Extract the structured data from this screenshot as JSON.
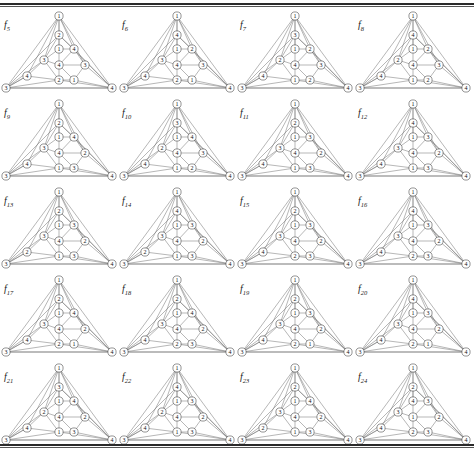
{
  "page": {
    "running_head": "",
    "figure_count": 20,
    "columns": 4,
    "rows": 5
  },
  "geometry": {
    "note": "normalised node slots shared by every graph drawing",
    "slots": {
      "apex": [
        59,
        8
      ],
      "left": [
        6,
        80
      ],
      "right": [
        112,
        80
      ],
      "upper": [
        59,
        27
      ],
      "mid_top": [
        59,
        41
      ],
      "right_top": [
        74,
        41
      ],
      "left_mid": [
        44,
        52
      ],
      "center": [
        59,
        57
      ],
      "right_mid": [
        85,
        57
      ],
      "far_left": [
        27,
        68
      ],
      "low_center": [
        59,
        72
      ],
      "low_right": [
        74,
        72
      ]
    },
    "edges": [
      [
        "apex",
        "left"
      ],
      [
        "apex",
        "right"
      ],
      [
        "left",
        "right"
      ],
      [
        "apex",
        "upper"
      ],
      [
        "apex",
        "left_mid"
      ],
      [
        "apex",
        "right_top"
      ],
      [
        "apex",
        "right_mid"
      ],
      [
        "apex",
        "far_left"
      ],
      [
        "apex",
        "mid_top"
      ],
      [
        "upper",
        "mid_top"
      ],
      [
        "upper",
        "left_mid"
      ],
      [
        "upper",
        "right_top"
      ],
      [
        "mid_top",
        "right_top"
      ],
      [
        "mid_top",
        "left_mid"
      ],
      [
        "mid_top",
        "center"
      ],
      [
        "right_top",
        "center"
      ],
      [
        "right_top",
        "right_mid"
      ],
      [
        "left_mid",
        "center"
      ],
      [
        "left_mid",
        "far_left"
      ],
      [
        "left_mid",
        "low_center"
      ],
      [
        "center",
        "right_mid"
      ],
      [
        "center",
        "low_center"
      ],
      [
        "center",
        "low_right"
      ],
      [
        "right_mid",
        "low_right"
      ],
      [
        "right_mid",
        "right"
      ],
      [
        "far_left",
        "low_center"
      ],
      [
        "far_left",
        "left"
      ],
      [
        "low_center",
        "low_right"
      ],
      [
        "low_center",
        "left"
      ],
      [
        "low_center",
        "right"
      ],
      [
        "low_right",
        "right"
      ],
      [
        "left",
        "far_left"
      ],
      [
        "left",
        "left_mid"
      ],
      [
        "right",
        "right_top"
      ],
      [
        "left",
        "upper"
      ],
      [
        "right",
        "upper"
      ]
    ]
  },
  "figures": [
    {
      "id": "f5",
      "caption": "f",
      "subscript": "5",
      "labels": {
        "apex": "1",
        "left": "3",
        "right": "4",
        "upper": "2",
        "mid_top": "1",
        "right_top": "4",
        "left_mid": "3",
        "center": "4",
        "right_mid": "3",
        "far_left": "4",
        "low_center": "2",
        "low_right": "1"
      }
    },
    {
      "id": "f6",
      "caption": "f",
      "subscript": "6",
      "labels": {
        "apex": "1",
        "left": "3",
        "right": "4",
        "upper": "4",
        "mid_top": "1",
        "right_top": "2",
        "left_mid": "3",
        "center": "4",
        "right_mid": "3",
        "far_left": "4",
        "low_center": "2",
        "low_right": "1"
      }
    },
    {
      "id": "f7",
      "caption": "f",
      "subscript": "7",
      "labels": {
        "apex": "1",
        "left": "3",
        "right": "4",
        "upper": "3",
        "mid_top": "1",
        "right_top": "2",
        "left_mid": "2",
        "center": "4",
        "right_mid": "3",
        "far_left": "4",
        "low_center": "1",
        "low_right": "2"
      }
    },
    {
      "id": "f8",
      "caption": "f",
      "subscript": "8",
      "labels": {
        "apex": "1",
        "left": "3",
        "right": "4",
        "upper": "4",
        "mid_top": "1",
        "right_top": "2",
        "left_mid": "2",
        "center": "4",
        "right_mid": "3",
        "far_left": "4",
        "low_center": "1",
        "low_right": "2"
      }
    },
    {
      "id": "f9",
      "caption": "f",
      "subscript": "9",
      "labels": {
        "apex": "1",
        "left": "3",
        "right": "4",
        "upper": "2",
        "mid_top": "1",
        "right_top": "4",
        "left_mid": "3",
        "center": "4",
        "right_mid": "2",
        "far_left": "4",
        "low_center": "1",
        "low_right": "3"
      }
    },
    {
      "id": "f10",
      "caption": "f",
      "subscript": "10",
      "labels": {
        "apex": "1",
        "left": "3",
        "right": "4",
        "upper": "3",
        "mid_top": "1",
        "right_top": "4",
        "left_mid": "2",
        "center": "4",
        "right_mid": "3",
        "far_left": "4",
        "low_center": "1",
        "low_right": "2"
      }
    },
    {
      "id": "f11",
      "caption": "f",
      "subscript": "11",
      "labels": {
        "apex": "1",
        "left": "3",
        "right": "4",
        "upper": "2",
        "mid_top": "1",
        "right_top": "3",
        "left_mid": "3",
        "center": "4",
        "right_mid": "2",
        "far_left": "4",
        "low_center": "1",
        "low_right": "3"
      }
    },
    {
      "id": "f12",
      "caption": "f",
      "subscript": "12",
      "labels": {
        "apex": "1",
        "left": "3",
        "right": "4",
        "upper": "4",
        "mid_top": "1",
        "right_top": "3",
        "left_mid": "3",
        "center": "4",
        "right_mid": "2",
        "far_left": "4",
        "low_center": "1",
        "low_right": "3"
      }
    },
    {
      "id": "f13",
      "caption": "f",
      "subscript": "13",
      "labels": {
        "apex": "1",
        "left": "3",
        "right": "4",
        "upper": "2",
        "mid_top": "1",
        "right_top": "3",
        "left_mid": "3",
        "center": "4",
        "right_mid": "2",
        "far_left": "2",
        "low_center": "1",
        "low_right": "3"
      }
    },
    {
      "id": "f14",
      "caption": "f",
      "subscript": "14",
      "labels": {
        "apex": "1",
        "left": "3",
        "right": "4",
        "upper": "4",
        "mid_top": "1",
        "right_top": "3",
        "left_mid": "3",
        "center": "4",
        "right_mid": "2",
        "far_left": "2",
        "low_center": "1",
        "low_right": "3"
      }
    },
    {
      "id": "f15",
      "caption": "f",
      "subscript": "15",
      "labels": {
        "apex": "1",
        "left": "3",
        "right": "4",
        "upper": "2",
        "mid_top": "1",
        "right_top": "3",
        "left_mid": "3",
        "center": "4",
        "right_mid": "2",
        "far_left": "4",
        "low_center": "2",
        "low_right": "3"
      }
    },
    {
      "id": "f16",
      "caption": "f",
      "subscript": "16",
      "labels": {
        "apex": "1",
        "left": "3",
        "right": "4",
        "upper": "4",
        "mid_top": "1",
        "right_top": "3",
        "left_mid": "3",
        "center": "4",
        "right_mid": "2",
        "far_left": "4",
        "low_center": "2",
        "low_right": "3"
      }
    },
    {
      "id": "f17",
      "caption": "f",
      "subscript": "17",
      "labels": {
        "apex": "1",
        "left": "3",
        "right": "4",
        "upper": "2",
        "mid_top": "1",
        "right_top": "4",
        "left_mid": "3",
        "center": "4",
        "right_mid": "2",
        "far_left": "4",
        "low_center": "2",
        "low_right": "1"
      }
    },
    {
      "id": "f18",
      "caption": "f",
      "subscript": "18",
      "labels": {
        "apex": "1",
        "left": "3",
        "right": "4",
        "upper": "2",
        "mid_top": "1",
        "right_top": "4",
        "left_mid": "3",
        "center": "4",
        "right_mid": "2",
        "far_left": "4",
        "low_center": "2",
        "low_right": "3"
      }
    },
    {
      "id": "f19",
      "caption": "f",
      "subscript": "19",
      "labels": {
        "apex": "1",
        "left": "3",
        "right": "4",
        "upper": "2",
        "mid_top": "1",
        "right_top": "3",
        "left_mid": "3",
        "center": "4",
        "right_mid": "2",
        "far_left": "4",
        "low_center": "2",
        "low_right": "1"
      }
    },
    {
      "id": "f20",
      "caption": "f",
      "subscript": "20",
      "labels": {
        "apex": "1",
        "left": "3",
        "right": "4",
        "upper": "4",
        "mid_top": "1",
        "right_top": "3",
        "left_mid": "3",
        "center": "4",
        "right_mid": "2",
        "far_left": "4",
        "low_center": "2",
        "low_right": "1"
      }
    },
    {
      "id": "f21",
      "caption": "f",
      "subscript": "21",
      "labels": {
        "apex": "1",
        "left": "3",
        "right": "4",
        "upper": "3",
        "mid_top": "1",
        "right_top": "4",
        "left_mid": "2",
        "center": "4",
        "right_mid": "2",
        "far_left": "4",
        "low_center": "1",
        "low_right": "3"
      }
    },
    {
      "id": "f22",
      "caption": "f",
      "subscript": "22",
      "labels": {
        "apex": "1",
        "left": "3",
        "right": "4",
        "upper": "4",
        "mid_top": "1",
        "right_top": "3",
        "left_mid": "2",
        "center": "4",
        "right_mid": "2",
        "far_left": "4",
        "low_center": "1",
        "low_right": "3"
      }
    },
    {
      "id": "f23",
      "caption": "f",
      "subscript": "23",
      "labels": {
        "apex": "1",
        "left": "3",
        "right": "4",
        "upper": "2",
        "mid_top": "1",
        "right_top": "4",
        "left_mid": "3",
        "center": "4",
        "right_mid": "2",
        "far_left": "2",
        "low_center": "1",
        "low_right": "3"
      }
    },
    {
      "id": "f24",
      "caption": "f",
      "subscript": "24",
      "labels": {
        "apex": "1",
        "left": "3",
        "right": "4",
        "upper": "2",
        "mid_top": "4",
        "right_top": "3",
        "left_mid": "3",
        "center": "1",
        "right_mid": "2",
        "far_left": "4",
        "low_center": "2",
        "low_right": "3"
      }
    }
  ]
}
